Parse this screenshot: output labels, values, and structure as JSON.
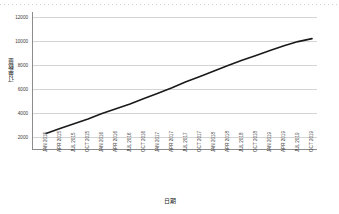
{
  "chart_data": {
    "type": "line",
    "title": "",
    "xlabel": "日期",
    "ylabel": "订单数量",
    "ylim": [
      2000,
      12000
    ],
    "y_ticks": [
      12000,
      10000,
      8000,
      6000,
      4000,
      2000
    ],
    "grid": true,
    "legend": "none",
    "x_rotation": -90,
    "categories": [
      "JAN 2015",
      "APR 2015",
      "JUL 2015",
      "OCT 2015",
      "JAN 2016",
      "APR 2016",
      "JUL 2016",
      "OCT 2016",
      "JAN 2017",
      "APR 2017",
      "JUL 2017",
      "OCT 2017",
      "JAN 2018",
      "APR 2018",
      "JUL 2018",
      "OCT 2018",
      "JAN 2019",
      "APR 2019",
      "JUL 2019",
      "OCT 2019"
    ],
    "series": [
      {
        "name": "订单数量",
        "color": "#1a1a1a",
        "values": [
          2300,
          2700,
          3100,
          3500,
          3950,
          4350,
          4750,
          5200,
          5650,
          6100,
          6600,
          7050,
          7500,
          7950,
          8400,
          8800,
          9200,
          9600,
          9950,
          10200
        ]
      }
    ]
  },
  "axis": {
    "y_title": "订单数量",
    "x_title": "日期"
  }
}
